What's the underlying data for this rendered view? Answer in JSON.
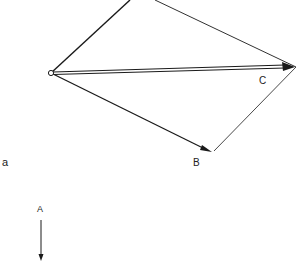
{
  "figure": {
    "panel_label": "a",
    "vectors": [
      {
        "name": "A",
        "label": "A",
        "description": "standalone downward vector"
      },
      {
        "name": "B",
        "label": "B",
        "description": "vector from origin to lower right"
      },
      {
        "name": "C",
        "label": "C",
        "description": "resultant vector (double line) from origin to right vertex"
      }
    ],
    "stroke_color": "#1a1a1a",
    "background": "#ffffff"
  }
}
